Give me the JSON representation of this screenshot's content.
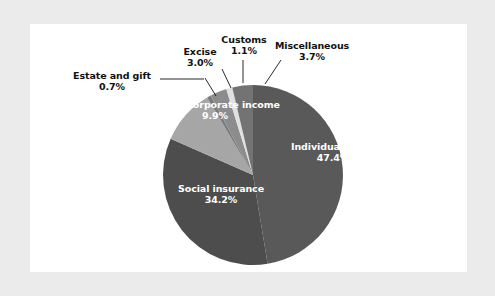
{
  "figure": {
    "background_color": "#ebebeb",
    "card_color": "#ffffff"
  },
  "chart_data": {
    "type": "pie",
    "title": "",
    "subtitle": "",
    "xlabel": "",
    "ylabel": "",
    "legend_position": "none",
    "grid": false,
    "units": "percent",
    "total": 100.0,
    "categories": [
      "Individual income",
      "Social insurance",
      "Corporate income",
      "Estate and gift",
      "Excise",
      "Customs",
      "Miscellaneous"
    ],
    "values": [
      47.4,
      34.2,
      9.9,
      0.7,
      3.0,
      1.1,
      3.7
    ],
    "slices": [
      {
        "label": "Individual income",
        "value": 47.4,
        "value_text": "47.4%",
        "color": "#595959",
        "label_placement": "inside",
        "label_color": "#ffffff"
      },
      {
        "label": "Social insurance",
        "value": 34.2,
        "value_text": "34.2%",
        "color": "#4d4d4d",
        "label_placement": "inside",
        "label_color": "#ffffff"
      },
      {
        "label": "Corporate income",
        "value": 9.9,
        "value_text": "9.9%",
        "color": "#a6a6a6",
        "label_placement": "inside",
        "label_color": "#ffffff"
      },
      {
        "label": "Estate and gift",
        "value": 0.7,
        "value_text": "0.7%",
        "color": "#7a7a7a",
        "label_placement": "outside",
        "label_color": "#111111"
      },
      {
        "label": "Excise",
        "value": 3.0,
        "value_text": "3.0%",
        "color": "#8c8c8c",
        "label_placement": "outside",
        "label_color": "#111111"
      },
      {
        "label": "Customs",
        "value": 1.1,
        "value_text": "1.1%",
        "color": "#e0e0e0",
        "label_placement": "outside",
        "label_color": "#111111"
      },
      {
        "label": "Miscellaneous",
        "value": 3.7,
        "value_text": "3.7%",
        "color": "#737373",
        "label_placement": "outside",
        "label_color": "#111111"
      }
    ]
  }
}
